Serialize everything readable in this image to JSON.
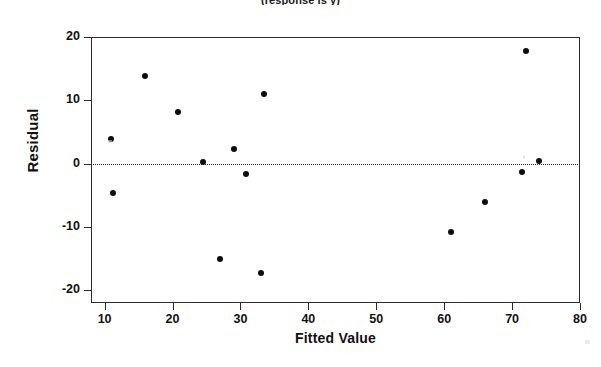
{
  "chart_data": {
    "type": "scatter",
    "title": "(response is y)",
    "xlabel": "Fitted Value",
    "ylabel": "Residual",
    "xlim": [
      8,
      80
    ],
    "ylim": [
      -22,
      20
    ],
    "xticks": [
      10,
      20,
      30,
      40,
      50,
      60,
      70,
      80
    ],
    "yticks": [
      20,
      10,
      0,
      -10,
      -20
    ],
    "grid": false,
    "legend": null,
    "reference_lines": [
      {
        "name": "zero-residual-line",
        "axis": "y",
        "value": 0,
        "style": "dotted"
      }
    ],
    "x": [
      11.0,
      11.3,
      16.0,
      20.8,
      24.5,
      27.0,
      29.0,
      30.8,
      33.0,
      33.5,
      61.0,
      66.0,
      71.5,
      72.0,
      74.0
    ],
    "y": [
      3.9,
      -4.7,
      13.8,
      8.1,
      0.2,
      -15.0,
      2.3,
      -1.6,
      -17.3,
      11.0,
      -10.8,
      -6.0,
      -1.3,
      17.8,
      0.5
    ],
    "points": [
      {
        "x": 11.0,
        "y": 3.9
      },
      {
        "x": 11.3,
        "y": -4.7
      },
      {
        "x": 16.0,
        "y": 13.8
      },
      {
        "x": 20.8,
        "y": 8.1
      },
      {
        "x": 24.5,
        "y": 0.2
      },
      {
        "x": 27.0,
        "y": -15.0
      },
      {
        "x": 29.0,
        "y": 2.3
      },
      {
        "x": 30.8,
        "y": -1.6
      },
      {
        "x": 33.0,
        "y": -17.3
      },
      {
        "x": 33.5,
        "y": 11.0
      },
      {
        "x": 61.0,
        "y": -10.8
      },
      {
        "x": 66.0,
        "y": -6.0
      },
      {
        "x": 71.5,
        "y": -1.3
      },
      {
        "x": 72.0,
        "y": 17.8
      },
      {
        "x": 74.0,
        "y": 0.5
      }
    ],
    "marker": {
      "shape": "circle",
      "color": "#0d0d0d",
      "size": 6
    }
  },
  "colors": {
    "axis": "#2b2b2b",
    "text": "#111111",
    "marker": "#0d0d0d",
    "background": "#ffffff"
  }
}
